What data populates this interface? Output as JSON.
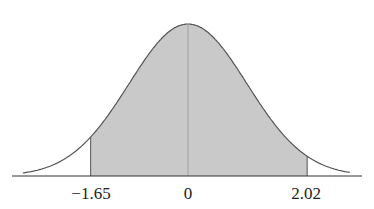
{
  "chart_data": {
    "type": "area",
    "title": "",
    "xlabel": "",
    "ylabel": "",
    "tick_labels": [
      "-1.65",
      "0",
      "2.02"
    ],
    "ticks": [
      -1.65,
      0,
      2.02
    ],
    "shaded_region": {
      "from": -1.65,
      "to": 2.02
    },
    "xlim": [
      -2.8,
      2.9
    ],
    "grid": false,
    "colors": {
      "shade": "#c8c8c8",
      "curve": "#555555",
      "axis": "#333333"
    }
  },
  "labels": {
    "left": "−1.65",
    "center": "0",
    "right": "2.02"
  }
}
